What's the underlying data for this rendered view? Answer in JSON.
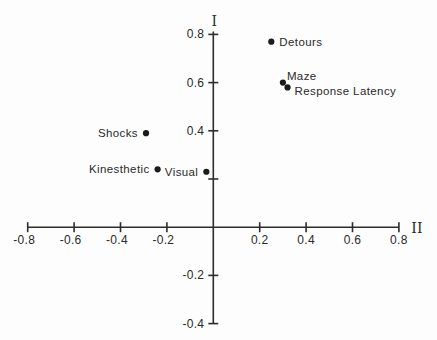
{
  "figure": {
    "background": "#fdfdfd",
    "ink_color": "#2d2d2d",
    "point_color": "#1b1b1b"
  },
  "chart_data": {
    "type": "scatter",
    "title": "",
    "xlabel": "II",
    "ylabel": "I",
    "xlim": [
      -0.8,
      0.8
    ],
    "ylim": [
      -0.4,
      0.8
    ],
    "grid": false,
    "legend": "none",
    "axis_style": "crossed-at-origin",
    "x_ticks": [
      {
        "value": -0.8,
        "label": "-0.8"
      },
      {
        "value": -0.6,
        "label": "-0.6"
      },
      {
        "value": -0.4,
        "label": "-0.4"
      },
      {
        "value": -0.2,
        "label": "-0.2"
      },
      {
        "value": 0.2,
        "label": "0.2"
      },
      {
        "value": 0.4,
        "label": "0.4"
      },
      {
        "value": 0.6,
        "label": "0.6"
      },
      {
        "value": 0.8,
        "label": "0.8"
      }
    ],
    "y_ticks": [
      {
        "value": 0.8,
        "label": "0.8"
      },
      {
        "value": 0.6,
        "label": "0.6"
      },
      {
        "value": 0.4,
        "label": "0.4"
      },
      {
        "value": 0.2,
        "label": ""
      },
      {
        "value": -0.2,
        "label": "-0.2"
      },
      {
        "value": -0.4,
        "label": "-0.4"
      }
    ],
    "points": [
      {
        "label": "Detours",
        "x": 0.25,
        "y": 0.77,
        "label_position": "right"
      },
      {
        "label": "Maze",
        "x": 0.3,
        "y": 0.6,
        "label_position": "above-right"
      },
      {
        "label": "Response Latency",
        "x": 0.32,
        "y": 0.58,
        "label_position": "below-right"
      },
      {
        "label": "Shocks",
        "x": -0.29,
        "y": 0.39,
        "label_position": "left"
      },
      {
        "label": "Kinesthetic",
        "x": -0.24,
        "y": 0.24,
        "label_position": "left"
      },
      {
        "label": "Visual",
        "x": -0.03,
        "y": 0.23,
        "label_position": "left"
      }
    ]
  }
}
